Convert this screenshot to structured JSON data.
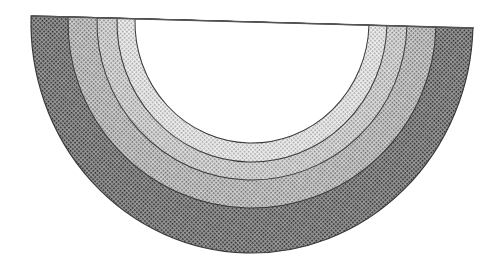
{
  "figure": {
    "center": {
      "x": 252,
      "y": 22
    },
    "tilt_deg": 1.6,
    "baseline": {
      "x1": 32,
      "y1": 16,
      "x2": 474,
      "y2": 28,
      "color": "#555555"
    },
    "bands": [
      {
        "name": "band-outer",
        "rx": 221,
        "ry": 231,
        "fill": "#5a5a5a",
        "dot": "#2a2a2a",
        "bg": "#9a9a9a",
        "pitch": 3
      },
      {
        "name": "band-3",
        "rx": 184,
        "ry": 186,
        "fill": "#9a9a9a",
        "dot": "#6a6a6a",
        "bg": "#cfcfcf",
        "pitch": 3
      },
      {
        "name": "band-2",
        "rx": 155,
        "ry": 158,
        "fill": "#b4b4b4",
        "dot": "#858585",
        "bg": "#dedede",
        "pitch": 3
      },
      {
        "name": "band-1",
        "rx": 135,
        "ry": 140,
        "fill": "#cfcfcf",
        "dot": "#a3a3a3",
        "bg": "#efefef",
        "pitch": 3
      },
      {
        "name": "band-inner-white",
        "rx": 117,
        "ry": 121,
        "fill": "#ffffff",
        "dot": null,
        "bg": "#ffffff",
        "pitch": 0
      }
    ],
    "outline_color": "#3a3a3a"
  }
}
